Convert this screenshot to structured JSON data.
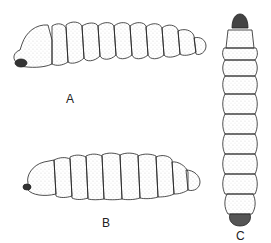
{
  "figure": {
    "panels": [
      {
        "id": "A",
        "label": "A",
        "view": "lateral (head left, curved dorsal)"
      },
      {
        "id": "B",
        "label": "B",
        "view": "lateral (head left, ventral side)"
      },
      {
        "id": "C",
        "label": "C",
        "view": "dorsal (head top)"
      }
    ],
    "colors": {
      "ink": "#222222",
      "stipple": "#555555",
      "background": "#ffffff"
    }
  }
}
